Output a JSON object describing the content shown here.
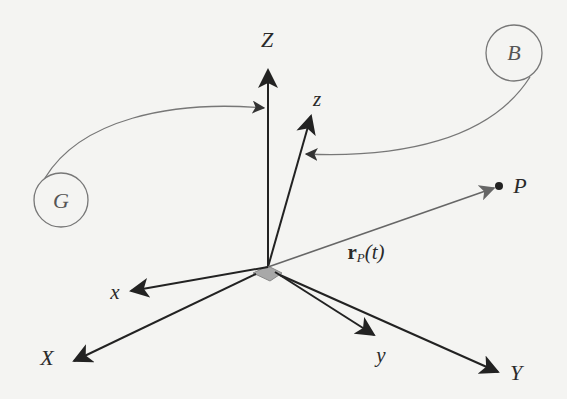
{
  "diagram": {
    "type": "coordinate-frames",
    "colors": {
      "background": "#f4f4f2",
      "axis": "#222222",
      "curve": "#777777",
      "position_vector": "#666666",
      "origin_patch": "#a8a8a8"
    },
    "inertial_frame": {
      "name": "G",
      "axes": [
        {
          "label": "X",
          "tip": [
            72,
            362
          ]
        },
        {
          "label": "Y",
          "tip": [
            500,
            373
          ]
        },
        {
          "label": "Z",
          "tip": [
            268,
            67
          ]
        }
      ]
    },
    "body_frame": {
      "name": "B",
      "axes": [
        {
          "label": "x",
          "tip": [
            128,
            292
          ]
        },
        {
          "label": "y",
          "tip": [
            376,
            336
          ]
        },
        {
          "label": "z",
          "tip": [
            312,
            113
          ]
        }
      ]
    },
    "origin": [
      268,
      267
    ],
    "point": {
      "label": "P",
      "position": [
        499,
        186
      ]
    },
    "position_vector": {
      "bold": "r",
      "subscript": "P",
      "arg": "(t)"
    },
    "circles": [
      {
        "label": "G",
        "center": [
          61,
          200
        ],
        "radius": 27,
        "links_to": "Z"
      },
      {
        "label": "B",
        "center": [
          514,
          53
        ],
        "radius": 28,
        "links_to": "z"
      }
    ]
  }
}
